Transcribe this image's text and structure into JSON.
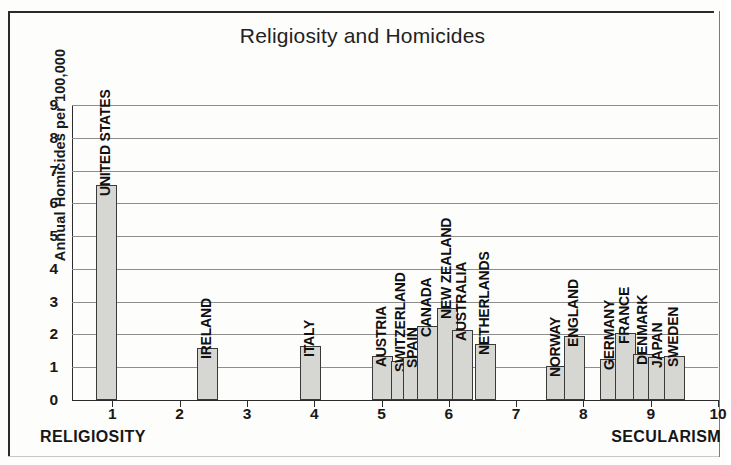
{
  "chart_data": {
    "type": "bar",
    "title": "Religiosity and Homicides",
    "xlabel": "",
    "ylabel": "Annual Homicides per 100,000",
    "ylim": [
      0,
      9
    ],
    "xlim": [
      0.4,
      10
    ],
    "grid": true,
    "legend": "none",
    "yticks": [
      "0",
      "1",
      "2",
      "3",
      "4",
      "5",
      "6",
      "7",
      "8",
      "9"
    ],
    "xticks": [
      "1",
      "2",
      "3",
      "4",
      "5",
      "6",
      "7",
      "8",
      "9",
      "10"
    ],
    "x_axis_left_annotation": "RELIGIOSITY",
    "x_axis_right_annotation": "SECULARISM",
    "categories": [
      "UNITED STATES",
      "IRELAND",
      "ITALY",
      "AUSTRIA",
      "SWITZERLAND",
      "SPAIN",
      "CANADA",
      "NEW ZEALAND",
      "AUSTRALIA",
      "NETHERLANDS",
      "NORWAY",
      "ENGLAND",
      "GERMANY",
      "FRANCE",
      "DENMARK",
      "JAPAN",
      "SWEDEN"
    ],
    "values": [
      6.55,
      1.6,
      1.65,
      1.35,
      1.2,
      1.3,
      2.25,
      2.8,
      2.15,
      1.7,
      1.05,
      1.95,
      1.25,
      2.05,
      1.4,
      1.3,
      1.35
    ],
    "points": [
      {
        "label": "UNITED STATES",
        "x": 0.92,
        "y": 6.55
      },
      {
        "label": "IRELAND",
        "x": 2.42,
        "y": 1.6
      },
      {
        "label": "ITALY",
        "x": 3.95,
        "y": 1.65
      },
      {
        "label": "AUSTRIA",
        "x": 5.02,
        "y": 1.35
      },
      {
        "label": "SWITZERLAND",
        "x": 5.3,
        "y": 1.2
      },
      {
        "label": "SPAIN",
        "x": 5.48,
        "y": 1.3
      },
      {
        "label": "CANADA",
        "x": 5.68,
        "y": 2.25
      },
      {
        "label": "NEW ZEALAND",
        "x": 5.98,
        "y": 2.8
      },
      {
        "label": "AUSTRALIA",
        "x": 6.2,
        "y": 2.15
      },
      {
        "label": "NETHERLANDS",
        "x": 6.55,
        "y": 1.7
      },
      {
        "label": "NORWAY",
        "x": 7.6,
        "y": 1.05
      },
      {
        "label": "ENGLAND",
        "x": 7.87,
        "y": 1.95
      },
      {
        "label": "GERMANY",
        "x": 8.4,
        "y": 1.25
      },
      {
        "label": "FRANCE",
        "x": 8.62,
        "y": 2.05
      },
      {
        "label": "DENMARK",
        "x": 8.9,
        "y": 1.4
      },
      {
        "label": "JAPAN",
        "x": 9.12,
        "y": 1.3
      },
      {
        "label": "SWEDEN",
        "x": 9.35,
        "y": 1.35
      }
    ]
  }
}
